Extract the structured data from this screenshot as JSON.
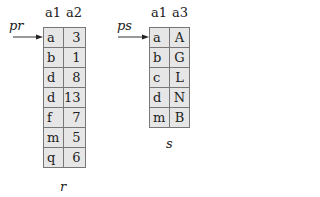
{
  "relations": [
    {
      "name": "r",
      "pointer": "pr",
      "columns": [
        "a1",
        "a2"
      ],
      "rows": [
        [
          "a",
          "3"
        ],
        [
          "b",
          "1"
        ],
        [
          "d",
          "8"
        ],
        [
          "d",
          "13"
        ],
        [
          "f",
          "7"
        ],
        [
          "m",
          "5"
        ],
        [
          "q",
          "6"
        ]
      ]
    },
    {
      "name": "s",
      "pointer": "ps",
      "columns": [
        "a1",
        "a3"
      ],
      "rows": [
        [
          "a",
          "A"
        ],
        [
          "b",
          "G"
        ],
        [
          "c",
          "L"
        ],
        [
          "d",
          "N"
        ],
        [
          "m",
          "B"
        ]
      ]
    }
  ]
}
